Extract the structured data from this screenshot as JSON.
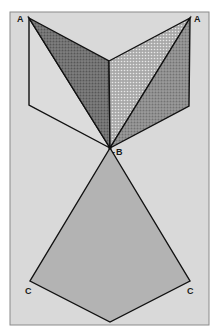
{
  "figure": {
    "background_color": "#ffffff",
    "frame_color": "#d9d9d9",
    "frame_border_color": "#8a8a8a",
    "stroke_color": "#111111",
    "colors": {
      "left_dark_triangle": "#6b6b6b",
      "center_light_triangle": "#c8c8c8",
      "right_dark_triangle": "#8c8c8c",
      "kite": "#b3b3b3",
      "left_outline_fill": "#dcdcdc"
    },
    "labels": {
      "a_left": "A",
      "a_right": "A",
      "b": "B",
      "b_prefix": "-",
      "c_left": "C",
      "c_right": "C"
    }
  }
}
